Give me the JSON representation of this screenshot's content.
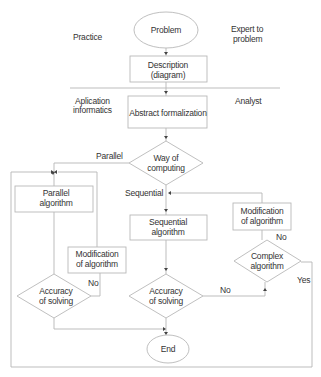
{
  "side_labels": {
    "practice": "Practice",
    "expert_line1": "Expert to",
    "expert_line2": "problem",
    "aplication_line1": "Aplication",
    "aplication_line2": "informatics",
    "analyst": "Analyst"
  },
  "nodes": {
    "problem": "Problem",
    "description_line1": "Description",
    "description_line2": "(diagram)",
    "abstract": "Abstract formalization",
    "way_line1": "Way of",
    "way_line2": "computing",
    "parallel_alg_line1": "Parallel",
    "parallel_alg_line2": "algorithm",
    "sequential_alg_line1": "Sequential",
    "sequential_alg_line2": "algorithm",
    "mod_right_line1": "Modification",
    "mod_right_line2": "of algorithm",
    "complex_line1": "Complex",
    "complex_line2": "algorithm",
    "mod_left_line1": "Modification",
    "mod_left_line2": "of algorithm",
    "acc_left_line1": "Accuracy",
    "acc_left_line2": "of solving",
    "acc_mid_line1": "Accuracy",
    "acc_mid_line2": "of solving",
    "end": "End"
  },
  "edge_labels": {
    "parallel": "Parallel",
    "sequential": "Sequential",
    "no_mod_right": "No",
    "yes_complex": "Yes",
    "no_acc_mid": "No",
    "no_acc_left": "No"
  }
}
